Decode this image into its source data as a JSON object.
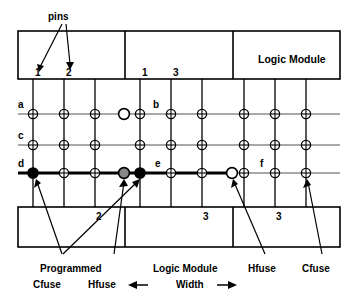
{
  "figure": {
    "title_text": "pins",
    "top_modules": [
      {
        "name": "module-left",
        "pin_labels": [
          "1",
          "2"
        ]
      },
      {
        "name": "module-middle",
        "pin_labels": [
          "1",
          "3"
        ]
      },
      {
        "name": "module-right",
        "label": "Logic Module",
        "pin_labels": []
      }
    ],
    "bottom_modules": [
      {
        "name": "bottom-left",
        "pin_labels": [
          "2"
        ]
      },
      {
        "name": "bottom-middle",
        "pin_labels": [
          "3"
        ]
      },
      {
        "name": "bottom-right",
        "pin_labels": [
          "3"
        ]
      }
    ],
    "row_labels": [
      "a",
      "c",
      "d"
    ],
    "segment_labels": [
      "b",
      "e",
      "f"
    ],
    "callouts": {
      "pins": "pins",
      "programmed_cfuse_line1": "Programmed",
      "programmed_cfuse_line2": "Cfuse",
      "hfuse_left": "Hfuse",
      "logic_module_width_line1": "Logic Module",
      "logic_module_width_line2": "Width",
      "hfuse_right": "Hfuse",
      "cfuse_right": "Cfuse",
      "arrow_left": "←",
      "arrow_right": "→"
    },
    "colors": {
      "line": "#000000",
      "grid_line": "#555555",
      "fuse_unprogrammed": "#ffffff",
      "fuse_programmed": "#000000",
      "fuse_partial": "#888888",
      "box_fill": "#ffffff"
    },
    "legend_symbols": [
      {
        "name": "crosshatch-fuse",
        "meaning": "Cfuse (unprogrammed cross fuse)"
      },
      {
        "name": "open-circle-fuse",
        "meaning": "Hfuse (unprogrammed horizontal fuse)"
      },
      {
        "name": "filled-circle-fuse",
        "meaning": "Programmed Cfuse"
      },
      {
        "name": "gray-circle-fuse",
        "meaning": "Programmed Hfuse"
      }
    ]
  }
}
